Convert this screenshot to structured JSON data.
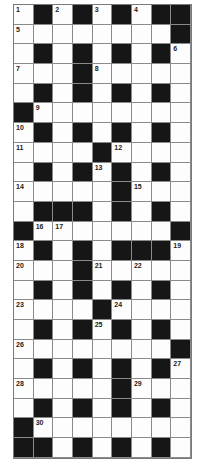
{
  "puzzle": {
    "type": "crossword",
    "rows": 23,
    "cols": 9,
    "grid": [
      "1#2#3#4##",
      "5.......#",
      ".#.#.#.#6",
      "7..#8....",
      ".#.#.#.#.",
      "#9.......",
      "A#.#.#.#.",
      "B...#C...",
      ".#.#D#.#.",
      "E....#F..",
      ".###.#.#.",
      "#GH.....#",
      "I#.#.###J",
      "K..#L.M..",
      ".#.#.#.#.",
      "N...#O...",
      ".#.#P#.#.",
      "Q.......#",
      ".#.#.#.#R",
      "S....#T..",
      ".#.#.#.#.",
      "#U.......",
      "##.#.#.#."
    ],
    "legend": {
      "#": "black",
      ".": "white",
      "1": 1,
      "2": 2,
      "3": 3,
      "4": 4,
      "5": 5,
      "6": 6,
      "7": 7,
      "8": 8,
      "9": 9,
      "A": 10,
      "B": 11,
      "C": 12,
      "D": 13,
      "E": 14,
      "F": 15,
      "G": 16,
      "H": 17,
      "I": 18,
      "J": 19,
      "K": 20,
      "L": 21,
      "M": 22,
      "N": 23,
      "O": 24,
      "P": 25,
      "Q": 26,
      "R": 27,
      "S": 28,
      "T": 29,
      "U": 30
    }
  },
  "colors": {
    "black_cell": "#161616",
    "white_cell": "#fdfdfd",
    "grid_line": "#8a8a8a"
  }
}
